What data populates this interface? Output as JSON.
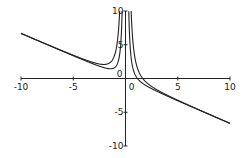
{
  "chart_data": {
    "type": "line",
    "title": "",
    "xlabel": "",
    "ylabel": "",
    "xlim": [
      -10,
      10
    ],
    "ylim": [
      -10,
      10
    ],
    "grid": false,
    "legend": null,
    "x_ticks": [
      -10,
      -5,
      0,
      5,
      10
    ],
    "x_tick_labels": [
      "-10",
      "-5",
      "0",
      "5",
      "10"
    ],
    "y_ticks": [
      -10,
      -5,
      0,
      5,
      10
    ],
    "y_tick_labels": [
      "-10",
      "-5",
      "0",
      "5",
      "10"
    ],
    "asymptote": "y = -2x/3",
    "series": [
      {
        "name": "curve-a",
        "formula": "y = -2x/3 + 1/x^2",
        "a": 1
      },
      {
        "name": "curve-b",
        "formula": "y = -2x/3 + 3/x^2",
        "a": 3
      }
    ],
    "line_color": "#222222"
  }
}
